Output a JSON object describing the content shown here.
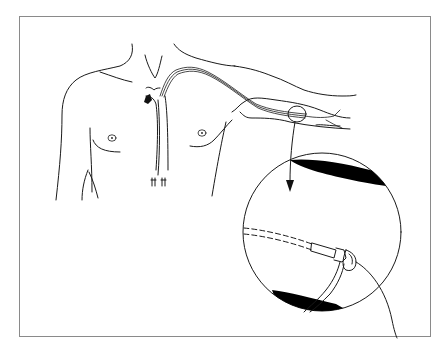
{
  "figure": {
    "description": "Illustration of a peripherally inserted central catheter (PICC) threaded from an upper-arm vein to the superior vena cava, with a magnified inset of the catheter hub at the insertion site",
    "colors": {
      "background": "#ffffff",
      "line": "#1a1a1a",
      "frame": "#8a8a8a",
      "fill": "#000000"
    },
    "elements": {
      "torso": "torso-outline",
      "arm": "outstretched-left-arm",
      "catheter": "catheter-line",
      "vein": "vena-cava",
      "magnifier_circle": "insertion-site-marker",
      "arrow": "zoom-arrow",
      "inset": "magnified-inset",
      "hub": "catheter-hub"
    }
  }
}
